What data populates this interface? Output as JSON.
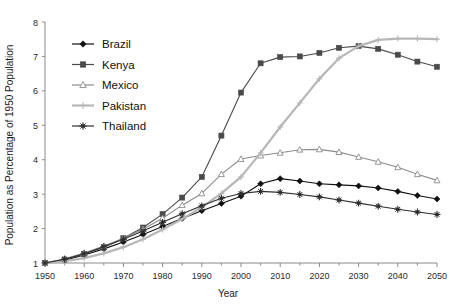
{
  "chart_data": {
    "type": "line",
    "title": "",
    "xlabel": "Year",
    "ylabel": "Population as Percentage of 1950 Population",
    "xlim": [
      1950,
      2050
    ],
    "ylim": [
      1,
      8
    ],
    "xticks": [
      1950,
      1960,
      1970,
      1980,
      1990,
      2000,
      2010,
      2020,
      2030,
      2040,
      2050
    ],
    "yticks": [
      1,
      2,
      3,
      4,
      5,
      6,
      7,
      8
    ],
    "grid": false,
    "legend_position": "upper-left-inside",
    "x": [
      1950,
      1955,
      1960,
      1965,
      1970,
      1975,
      1980,
      1985,
      1990,
      1995,
      2000,
      2005,
      2010,
      2015,
      2020,
      2025,
      2030,
      2035,
      2040,
      2045,
      2050
    ],
    "series": [
      {
        "name": "Brazil",
        "marker": "diamond",
        "color": "#111111",
        "values": [
          1.0,
          1.08,
          1.23,
          1.41,
          1.61,
          1.83,
          2.06,
          2.29,
          2.52,
          2.73,
          2.94,
          3.3,
          3.45,
          3.38,
          3.3,
          3.27,
          3.24,
          3.18,
          3.08,
          2.96,
          2.86
        ]
      },
      {
        "name": "Kenya",
        "marker": "square",
        "color": "#4a4a4a",
        "values": [
          1.0,
          1.1,
          1.26,
          1.46,
          1.72,
          2.03,
          2.42,
          2.9,
          3.5,
          4.7,
          5.95,
          6.8,
          6.98,
          7.0,
          7.1,
          7.25,
          7.3,
          7.22,
          7.05,
          6.85,
          6.7
        ]
      },
      {
        "name": "Mexico",
        "marker": "triangle",
        "color": "#8c8c8c",
        "values": [
          1.0,
          1.12,
          1.29,
          1.49,
          1.72,
          1.98,
          2.3,
          2.68,
          3.02,
          3.58,
          4.02,
          4.12,
          4.2,
          4.29,
          4.3,
          4.22,
          4.08,
          3.94,
          3.78,
          3.58,
          3.4
        ]
      },
      {
        "name": "Pakistan",
        "marker": "plus",
        "color": "#b7b7b7",
        "values": [
          1.0,
          1.05,
          1.14,
          1.28,
          1.46,
          1.69,
          1.97,
          2.28,
          2.62,
          3.02,
          3.5,
          4.2,
          4.95,
          5.65,
          6.35,
          6.95,
          7.3,
          7.48,
          7.52,
          7.52,
          7.5
        ]
      },
      {
        "name": "Thailand",
        "marker": "star",
        "color": "#2e2e2e",
        "values": [
          1.0,
          1.11,
          1.27,
          1.47,
          1.69,
          1.93,
          2.18,
          2.43,
          2.66,
          2.88,
          3.02,
          3.08,
          3.05,
          2.99,
          2.92,
          2.83,
          2.74,
          2.65,
          2.56,
          2.48,
          2.41
        ]
      }
    ]
  },
  "legend": {
    "items": [
      {
        "label": "Brazil"
      },
      {
        "label": "Kenya"
      },
      {
        "label": "Mexico"
      },
      {
        "label": "Pakistan"
      },
      {
        "label": "Thailand"
      }
    ]
  }
}
